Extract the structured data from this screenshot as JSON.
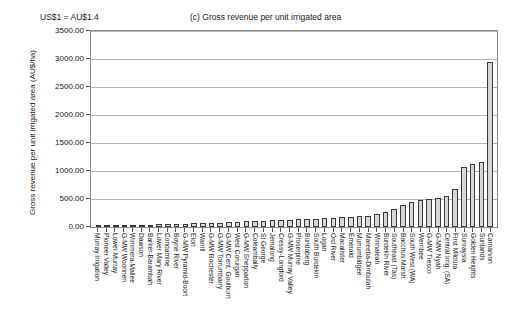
{
  "annotation": "US$1 = AU$1.4",
  "chart_data": {
    "type": "bar",
    "title": "(c) Gross revenue per unit irrigated area",
    "xlabel": "",
    "ylabel": "Gross revenue per unit irrigated area (AU$/ha)",
    "ylim": [
      0,
      3500
    ],
    "ytick_labels": [
      "3500.00",
      "3000.00",
      "2500.00",
      "2000.00",
      "1500.00",
      "1000.00",
      "500.00",
      "0.00"
    ],
    "ytick_values": [
      3500,
      3000,
      2500,
      2000,
      1500,
      1000,
      500,
      0
    ],
    "grid": true,
    "legend": "none",
    "bar_fill": "#d7d7d7",
    "bar_edge": "#3a3a3a",
    "categories": [
      "Murray Irrigation",
      "Pioneer Valley",
      "Lower Murray",
      "G-MW Woorinen",
      "Wimmera-Mallee",
      "Dawson",
      "Barker-Barambah",
      "Lower Mary River",
      "Condamine",
      "Boyne River",
      "G-MW Pyramid-Boort",
      "Eton",
      "Warrill",
      "G-MW Rochester",
      "G-MW Torrumbarry",
      "G-MW Cent. Goulburn",
      "West Corurgan",
      "G-MW Shepparton",
      "Coleambally",
      "St George",
      "Jemalong",
      "Cressy-Longford",
      "G-MW Murray Valley",
      "Proserpine",
      "Bundaberg",
      "South Burdekin",
      "Logan",
      "Ord River",
      "Macalister",
      "Emerald",
      "Murrumbidgee",
      "Mareeba-Dimbulah",
      "Winnaleah",
      "Burdekin River",
      "Southeast (Tas)",
      "Bacchus Marsh",
      "South West (WA)",
      "Werribee",
      "G-MW Tresco",
      "G-MW Nyah",
      "Central Irrig. (SA)",
      "First Mildura",
      "Sunraysia",
      "Golden Heights",
      "Sunlands",
      "Carnarvon"
    ],
    "values": [
      10,
      15,
      20,
      25,
      30,
      35,
      40,
      45,
      50,
      55,
      60,
      65,
      70,
      75,
      80,
      90,
      95,
      100,
      110,
      115,
      120,
      125,
      130,
      135,
      140,
      150,
      155,
      160,
      170,
      180,
      190,
      200,
      230,
      270,
      330,
      390,
      440,
      490,
      500,
      510,
      560,
      680,
      1070,
      1130,
      1160,
      2950
    ]
  }
}
